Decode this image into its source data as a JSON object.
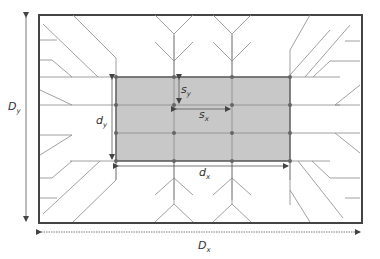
{
  "diagram": {
    "type": "grid layout with dimension annotations",
    "labels": {
      "Dy": {
        "main": "D",
        "sub": "y"
      },
      "Dx": {
        "main": "D",
        "sub": "x"
      },
      "dy": {
        "main": "d",
        "sub": "y"
      },
      "dx": {
        "main": "d",
        "sub": "x"
      },
      "sy": {
        "main": "s",
        "sub": "y"
      },
      "sx": {
        "main": "s",
        "sub": "x"
      }
    },
    "colors": {
      "outer_border": "#444444",
      "inner_fill": "#c8c8c8",
      "line": "#777777",
      "node": "#666666"
    },
    "grid": {
      "columns": 4,
      "rows": 4
    }
  }
}
